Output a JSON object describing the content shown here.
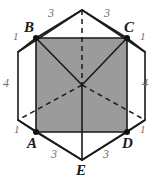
{
  "figure": {
    "type": "geometry-diagram",
    "colors": {
      "stroke": "#1a1a1a",
      "shade_fill": "#9b9b9b",
      "label_length": "#6e6e6e",
      "label_vertex": "#1a1a1a",
      "background": "#ffffff"
    },
    "vertices": [
      {
        "id": "T",
        "label": "",
        "x": 82,
        "y": 10,
        "dot": false
      },
      {
        "id": "B",
        "label": "B",
        "x": 36,
        "y": 38,
        "dot": true
      },
      {
        "id": "C",
        "label": "C",
        "x": 127,
        "y": 38,
        "dot": true
      },
      {
        "id": "L",
        "label": "",
        "x": 18,
        "y": 52,
        "dot": false
      },
      {
        "id": "R",
        "label": "",
        "x": 145,
        "y": 52,
        "dot": false
      },
      {
        "id": "M",
        "label": "",
        "x": 82,
        "y": 85,
        "dot": false
      },
      {
        "id": "Lb",
        "label": "",
        "x": 18,
        "y": 120,
        "dot": false
      },
      {
        "id": "Rb",
        "label": "",
        "x": 145,
        "y": 120,
        "dot": false
      },
      {
        "id": "A",
        "label": "A",
        "x": 36,
        "y": 132,
        "dot": true
      },
      {
        "id": "D",
        "label": "D",
        "x": 127,
        "y": 132,
        "dot": true
      },
      {
        "id": "E",
        "label": "E",
        "x": 82,
        "y": 160,
        "dot": false
      }
    ],
    "shaded_region": "A-B-C-D rectangle",
    "vertex_labels": [
      {
        "name": "vertex-label-B",
        "text": "B",
        "x": 24,
        "y": 20
      },
      {
        "name": "vertex-label-C",
        "text": "C",
        "x": 124,
        "y": 20
      },
      {
        "name": "vertex-label-A",
        "text": "A",
        "x": 27,
        "y": 136
      },
      {
        "name": "vertex-label-D",
        "text": "D",
        "x": 122,
        "y": 136
      },
      {
        "name": "vertex-label-E",
        "text": "E",
        "x": 76,
        "y": 163
      }
    ],
    "length_labels": [
      {
        "name": "edge-length-top-left",
        "text": "3",
        "x": 48,
        "y": 7
      },
      {
        "name": "edge-length-top-right",
        "text": "3",
        "x": 104,
        "y": 7
      },
      {
        "name": "edge-length-left",
        "text": "4",
        "x": 3,
        "y": 77
      },
      {
        "name": "edge-length-right",
        "text": "4",
        "x": 142,
        "y": 77
      },
      {
        "name": "edge-length-bottom-left",
        "text": "3",
        "x": 51,
        "y": 148
      },
      {
        "name": "edge-length-bottom-right",
        "text": "3",
        "x": 103,
        "y": 148
      }
    ],
    "unit_labels": [
      {
        "name": "unit-length-near-B",
        "text": "1",
        "x": 13,
        "y": 31
      },
      {
        "name": "unit-length-near-C",
        "text": "1",
        "x": 140,
        "y": 31
      },
      {
        "name": "unit-length-near-A",
        "text": "1",
        "x": 14,
        "y": 124
      },
      {
        "name": "unit-length-near-D",
        "text": "1",
        "x": 140,
        "y": 124
      }
    ]
  }
}
